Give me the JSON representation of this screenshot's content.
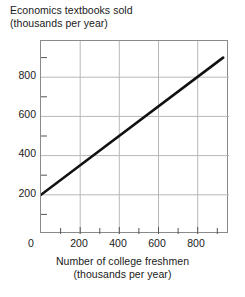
{
  "chart_data": {
    "type": "line",
    "title": "Economics textbooks sold",
    "title_line2": "(thousands per year)",
    "ylabel": "Economics textbooks sold (thousands per year)",
    "xlabel": "Number of college freshmen",
    "xlabel_line2": "(thousands per year)",
    "xlim": [
      0,
      960
    ],
    "ylim": [
      0,
      985
    ],
    "grid": true,
    "grid_color": "#b8b8b8",
    "legend": "none",
    "line_color": "#111111",
    "line_width": 2.6,
    "x_ticks": [
      0,
      200,
      400,
      600,
      800
    ],
    "x_tick_labels": [
      "0",
      "200",
      "400",
      "600",
      "800"
    ],
    "x_minor_tick_step": 100,
    "y_ticks": [
      200,
      400,
      600,
      800
    ],
    "y_tick_labels": [
      "200",
      "400",
      "600",
      "800"
    ],
    "y_minor_tick_step": 100,
    "series": [
      {
        "name": "Economics textbooks sold",
        "x": [
          0,
          930
        ],
        "y": [
          200,
          900
        ],
        "points": [
          {
            "x": 0,
            "y": 200
          },
          {
            "x": 200,
            "y": 350
          },
          {
            "x": 400,
            "y": 500
          },
          {
            "x": 600,
            "y": 650
          },
          {
            "x": 800,
            "y": 800
          },
          {
            "x": 930,
            "y": 900
          }
        ],
        "slope": 0.75,
        "intercept": 200
      }
    ]
  },
  "axis_labels": {
    "y": [
      {
        "value": 800,
        "label": "800"
      },
      {
        "value": 600,
        "label": "600"
      },
      {
        "value": 400,
        "label": "400"
      },
      {
        "value": 200,
        "label": "200"
      }
    ],
    "x": [
      {
        "value": 0,
        "label": "0"
      },
      {
        "value": 200,
        "label": "200"
      },
      {
        "value": 400,
        "label": "400"
      },
      {
        "value": 600,
        "label": "600"
      },
      {
        "value": 800,
        "label": "800"
      }
    ]
  },
  "colors": {
    "line": "#111111",
    "grid": "#b8b8b8",
    "frame": "#8a8a8a",
    "text": "#1a1a1a",
    "background": "#ffffff"
  }
}
